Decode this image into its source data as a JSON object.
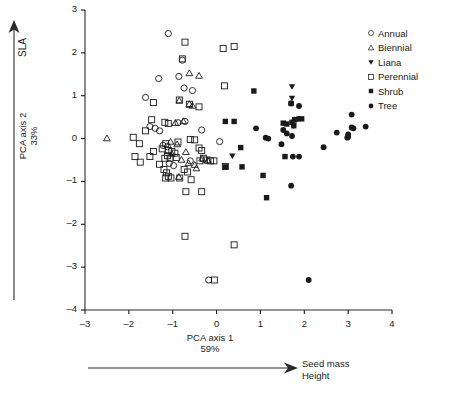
{
  "figure": {
    "background": "#ffffff",
    "foreground": "#1a1a1a"
  },
  "axes": {
    "x_title_line1": "PCA axis 1",
    "x_title_line2": "59%",
    "y_title_line1": "PCA axis 2",
    "y_title_line2": "33%",
    "x_ticks": [
      "-3",
      "-2",
      "-1",
      "0",
      "1",
      "2",
      "3",
      "4"
    ],
    "y_ticks": [
      "3",
      "2",
      "1",
      "0",
      "-1",
      "-2",
      "-3",
      "-4"
    ]
  },
  "annotations": {
    "sla_arrow_label": "SLA",
    "gradient_label_line1": "Seed mass",
    "gradient_label_line2": "Height"
  },
  "legend": {
    "items": [
      {
        "label": "Annual",
        "marker": "open-circle"
      },
      {
        "label": "Biennial",
        "marker": "open-triangle-up"
      },
      {
        "label": "Liana",
        "marker": "filled-triangle-down"
      },
      {
        "label": "Perennial",
        "marker": "open-square"
      },
      {
        "label": "Shrub",
        "marker": "filled-square"
      },
      {
        "label": "Tree",
        "marker": "filled-circle"
      }
    ]
  },
  "chart_data": {
    "type": "scatter",
    "title": "",
    "xlabel": "PCA axis 1 59%",
    "ylabel": "PCA axis 2 33%",
    "xlim": [
      -3,
      4
    ],
    "ylim": [
      -4,
      3
    ],
    "grid": false,
    "legend_position": "top-right",
    "series": [
      {
        "name": "Annual",
        "marker": "open-circle",
        "points": [
          [
            -1.1,
            2.45
          ],
          [
            -0.78,
            1.83
          ],
          [
            -1.32,
            1.4
          ],
          [
            -0.86,
            1.45
          ],
          [
            -0.74,
            1.18
          ],
          [
            -0.55,
            1.12
          ],
          [
            -1.62,
            0.96
          ],
          [
            -1.52,
            0.28
          ],
          [
            -1.4,
            0.24
          ],
          [
            -1.3,
            0.18
          ],
          [
            -0.88,
            0.37
          ],
          [
            -0.72,
            0.4
          ],
          [
            -0.34,
            0.2
          ],
          [
            -1.22,
            -0.16
          ],
          [
            -1.12,
            -0.19
          ],
          [
            -1.08,
            -0.58
          ],
          [
            0.07,
            -0.07
          ],
          [
            -0.98,
            -0.63
          ],
          [
            -0.18,
            -3.3
          ],
          [
            -0.6,
            -0.52
          ]
        ]
      },
      {
        "name": "Biennial",
        "marker": "open-triangle-up",
        "points": [
          [
            -2.5,
            0.0
          ],
          [
            -0.62,
            1.52
          ],
          [
            -0.4,
            1.46
          ],
          [
            -0.85,
            0.88
          ],
          [
            -0.62,
            0.8
          ],
          [
            -0.55,
            0.76
          ],
          [
            -0.76,
            0.4
          ],
          [
            -0.94,
            0.36
          ],
          [
            -1.05,
            -0.08
          ],
          [
            -0.9,
            -0.14
          ],
          [
            -1.02,
            -0.36
          ],
          [
            -0.7,
            -0.32
          ],
          [
            -0.8,
            -0.5
          ],
          [
            -0.64,
            -0.58
          ],
          [
            -0.5,
            -0.62
          ],
          [
            -0.86,
            -0.9
          ],
          [
            -0.46,
            -0.7
          ],
          [
            -0.33,
            -0.47
          ],
          [
            -0.2,
            -0.52
          ]
        ]
      },
      {
        "name": "Liana",
        "marker": "filled-triangle-down",
        "points": [
          [
            1.72,
            1.22
          ],
          [
            1.72,
            0.95
          ],
          [
            1.75,
            0.3
          ],
          [
            0.36,
            -0.4
          ]
        ]
      },
      {
        "name": "Perennial",
        "marker": "open-square",
        "points": [
          [
            -0.72,
            2.25
          ],
          [
            0.15,
            2.1
          ],
          [
            0.4,
            2.15
          ],
          [
            -0.78,
            1.86
          ],
          [
            0.18,
            1.23
          ],
          [
            -1.44,
            0.84
          ],
          [
            -0.85,
            0.9
          ],
          [
            -1.48,
            0.44
          ],
          [
            -1.18,
            0.38
          ],
          [
            -1.1,
            0.35
          ],
          [
            -0.62,
            0.8
          ],
          [
            -0.4,
            0.74
          ],
          [
            -1.9,
            0.03
          ],
          [
            -1.62,
            0.18
          ],
          [
            -1.76,
            -0.12
          ],
          [
            -1.86,
            -0.42
          ],
          [
            -1.74,
            -0.55
          ],
          [
            -1.44,
            -0.3
          ],
          [
            -1.52,
            -0.42
          ],
          [
            -1.16,
            -0.12
          ],
          [
            -1.24,
            -0.24
          ],
          [
            -1.1,
            -0.28
          ],
          [
            -1.02,
            -0.3
          ],
          [
            -0.95,
            -0.34
          ],
          [
            -1.12,
            -0.4
          ],
          [
            -1.18,
            -0.46
          ],
          [
            -1.06,
            -0.46
          ],
          [
            -0.92,
            -0.44
          ],
          [
            -0.6,
            -0.02
          ],
          [
            -0.5,
            -0.03
          ],
          [
            -0.4,
            -0.22
          ],
          [
            -0.34,
            -0.28
          ],
          [
            -0.3,
            -0.46
          ],
          [
            -0.38,
            -0.52
          ],
          [
            -0.22,
            -0.5
          ],
          [
            -0.14,
            -0.52
          ],
          [
            -0.06,
            -0.52
          ],
          [
            -1.2,
            -0.72
          ],
          [
            -1.14,
            -0.8
          ],
          [
            -1.1,
            -0.88
          ],
          [
            -1.16,
            -0.92
          ],
          [
            -1.04,
            -0.92
          ],
          [
            -0.84,
            -0.92
          ],
          [
            -0.74,
            -0.72
          ],
          [
            -0.66,
            -0.78
          ],
          [
            -0.58,
            -0.96
          ],
          [
            -0.7,
            -1.24
          ],
          [
            -0.34,
            -1.24
          ],
          [
            -0.72,
            -2.28
          ],
          [
            0.4,
            -2.48
          ],
          [
            -0.05,
            -3.3
          ],
          [
            0.2,
            -0.65
          ],
          [
            -1.3,
            -0.6
          ],
          [
            -0.88,
            -0.08
          ]
        ]
      },
      {
        "name": "Shrub",
        "marker": "filled-square",
        "points": [
          [
            0.85,
            1.11
          ],
          [
            0.2,
            0.4
          ],
          [
            0.4,
            0.4
          ],
          [
            0.55,
            -0.21
          ],
          [
            0.2,
            -0.66
          ],
          [
            0.58,
            -0.66
          ],
          [
            1.06,
            -0.86
          ],
          [
            1.14,
            -1.38
          ],
          [
            1.52,
            0.36
          ],
          [
            1.6,
            0.34
          ],
          [
            1.72,
            0.38
          ],
          [
            1.78,
            0.44
          ],
          [
            1.94,
            0.46
          ],
          [
            1.56,
            -0.42
          ],
          [
            1.76,
            0.3
          ],
          [
            1.7,
            0.82
          ]
        ]
      },
      {
        "name": "Tree",
        "marker": "filled-circle",
        "points": [
          [
            0.9,
            0.24
          ],
          [
            1.12,
            0.02
          ],
          [
            1.18,
            0.0
          ],
          [
            1.48,
            -0.13
          ],
          [
            1.52,
            0.2
          ],
          [
            1.7,
            0.82
          ],
          [
            1.88,
            0.76
          ],
          [
            1.6,
            0.12
          ],
          [
            1.72,
            0.06
          ],
          [
            1.78,
            0.44
          ],
          [
            1.86,
            0.46
          ],
          [
            1.74,
            -0.42
          ],
          [
            1.88,
            -0.42
          ],
          [
            1.7,
            -1.1
          ],
          [
            2.1,
            -3.3
          ],
          [
            2.44,
            -0.2
          ],
          [
            2.74,
            0.14
          ],
          [
            2.98,
            0.02
          ],
          [
            3.0,
            0.04
          ],
          [
            3.08,
            0.26
          ],
          [
            3.12,
            0.24
          ],
          [
            3.08,
            0.56
          ],
          [
            3.4,
            0.28
          ],
          [
            3.0,
            0.1
          ]
        ]
      }
    ]
  }
}
